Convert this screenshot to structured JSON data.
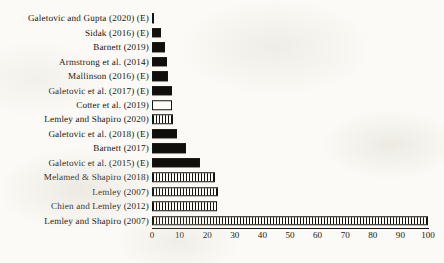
{
  "chart_data": {
    "type": "bar",
    "orientation": "horizontal",
    "title": "",
    "xlabel": "",
    "ylabel": "",
    "xlim": [
      0,
      100
    ],
    "xticks": [
      0,
      10,
      20,
      30,
      40,
      50,
      60,
      70,
      80,
      90,
      100
    ],
    "xticklabels": [
      "0",
      "10",
      "20",
      "30",
      "40",
      "50",
      "60",
      "70",
      "80",
      "90",
      "100"
    ],
    "grid": false,
    "legend": null,
    "categories": [
      "Galetovic and Gupta (2020) (E)",
      "Sidak (2016) (E)",
      "Barnett (2019)",
      "Armstrong et al. (2014)",
      "Mallinson (2016) (E)",
      "Galetovic et al. (2017) (E)",
      "Cotter et al. (2019)",
      "Lemley and Shapiro (2020)",
      "Galetovic et al. (2018) (E)",
      "Barnett (2017)",
      "Galetovic et al. (2015) (E)",
      "Melamed & Shapiro (2018)",
      "Lemley (2007)",
      "Chien and Lemley (2012)",
      "Lemley and Shapiro (2007)"
    ],
    "values": [
      0.5,
      3.4,
      4.6,
      5.4,
      5.8,
      7.2,
      7.3,
      7.5,
      9.0,
      12.3,
      17.3,
      22.8,
      23.8,
      23.4,
      100
    ],
    "bar_styles": [
      "solid",
      "solid",
      "solid",
      "solid",
      "solid",
      "solid",
      "hollow",
      "hatch",
      "solid",
      "solid",
      "solid",
      "hatch",
      "hatch",
      "hatch",
      "hatch"
    ]
  },
  "colors": {
    "bar_fill_solid": "#100f0b",
    "bar_fill_hollow": "#fdfcf8",
    "bar_edge": "#15130e",
    "axis": "#16140f",
    "text": "#17150f",
    "background": "#fbfaf6"
  }
}
